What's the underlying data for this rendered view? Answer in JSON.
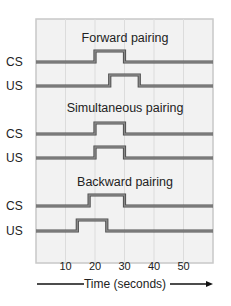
{
  "figure": {
    "x_axis": {
      "label": "Time (seconds)",
      "ticks": [
        10,
        20,
        30,
        40,
        50
      ],
      "range": [
        0,
        60
      ]
    },
    "panels": [
      {
        "title": "Forward pairing",
        "signals": [
          {
            "name": "CS",
            "on": 20,
            "off": 30
          },
          {
            "name": "US",
            "on": 25,
            "off": 35
          }
        ]
      },
      {
        "title": "Simultaneous pairing",
        "signals": [
          {
            "name": "CS",
            "on": 20,
            "off": 30
          },
          {
            "name": "US",
            "on": 20,
            "off": 30
          }
        ]
      },
      {
        "title": "Backward pairing",
        "signals": [
          {
            "name": "CS",
            "on": 18,
            "off": 30
          },
          {
            "name": "US",
            "on": 14,
            "off": 24
          }
        ]
      }
    ],
    "colors": {
      "frame_bg": "#f2f2f2",
      "frame_border": "#c8c8c8",
      "grid": "#dcdcdc",
      "signal": "#6e6e6e",
      "text": "#222222"
    }
  }
}
